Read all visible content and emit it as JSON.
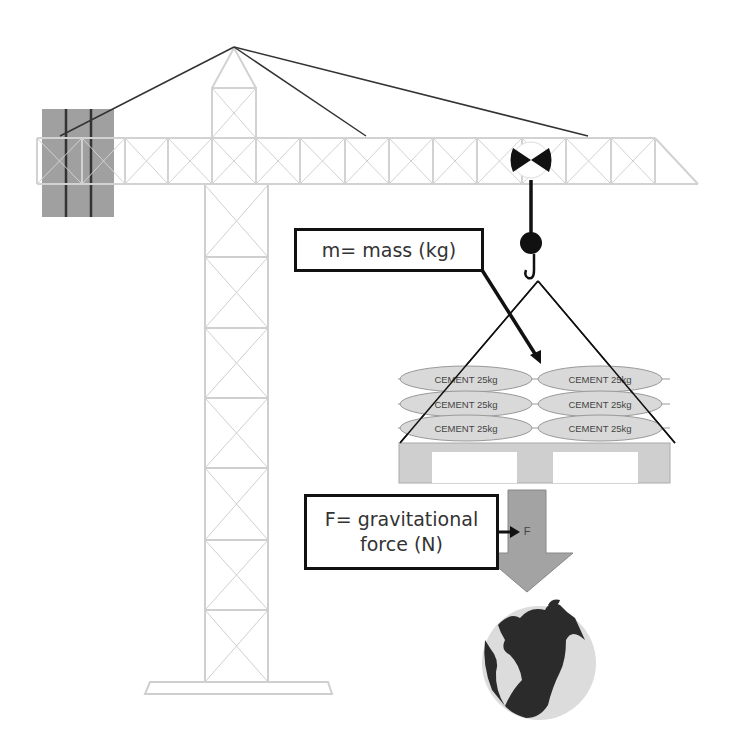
{
  "diagram": {
    "labels": {
      "mass": "m= mass (kg)",
      "force_line1": "F= gravitational",
      "force_line2": "force (N)",
      "force_arrow": "F"
    },
    "cement_bags": [
      {
        "row": 1,
        "col": 1,
        "text": "CEMENT 25kg"
      },
      {
        "row": 1,
        "col": 2,
        "text": "CEMENT 25kg"
      },
      {
        "row": 2,
        "col": 1,
        "text": "CEMENT 25kg"
      },
      {
        "row": 2,
        "col": 2,
        "text": "CEMENT 25kg"
      },
      {
        "row": 3,
        "col": 1,
        "text": "CEMENT 25kg"
      },
      {
        "row": 3,
        "col": 2,
        "text": "CEMENT 25kg"
      }
    ],
    "colors": {
      "structure": "#d0d0d0",
      "counterweight": "#9a9a9a",
      "cable": "#333333",
      "bag_fill": "#d8d8d8",
      "arrow_fill": "#a0a0a0",
      "earth_land": "#2b2b2b",
      "earth_ocean": "#dcdcdc"
    }
  }
}
